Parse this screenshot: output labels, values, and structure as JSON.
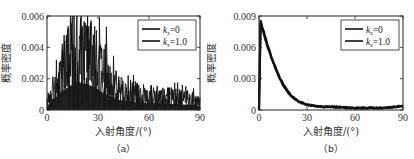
{
  "chart_data": [
    {
      "id": "a",
      "type": "line",
      "caption": "（a）",
      "title": "",
      "xlabel": "入射角度/(°)",
      "ylabel": "概率密度",
      "xlim": [
        0,
        90
      ],
      "ylim": [
        0,
        0.006
      ],
      "xticks": [
        "0",
        "30",
        "60",
        "90"
      ],
      "yticks": [
        "0",
        "0.002",
        "0.004",
        "0.006"
      ],
      "grid": false,
      "legend_position": "upper right",
      "series": [
        {
          "name": "k_s=0",
          "label_main": "k",
          "label_sub": "s",
          "label_rest": "=0",
          "color": "#111111",
          "note": "noisy histogram-like density peaking ~0.005 near 18°, decaying to ~0.0005–0.001 beyond 50°",
          "x": [
            0,
            3,
            6,
            9,
            12,
            15,
            18,
            21,
            24,
            27,
            30,
            33,
            36,
            39,
            42,
            45,
            48,
            51,
            54,
            57,
            60,
            63,
            66,
            69,
            72,
            75,
            78,
            81,
            84,
            87,
            90
          ],
          "values": [
            0.0004,
            0.0012,
            0.0016,
            0.0022,
            0.0026,
            0.003,
            0.0033,
            0.0031,
            0.003,
            0.0027,
            0.0024,
            0.002,
            0.0017,
            0.0014,
            0.0012,
            0.0011,
            0.001,
            0.0009,
            0.0009,
            0.0008,
            0.0008,
            0.0008,
            0.0008,
            0.0007,
            0.0007,
            0.0007,
            0.0007,
            0.0006,
            0.0006,
            0.0006,
            0.0004
          ]
        },
        {
          "name": "k_s=1.0",
          "label_main": "k",
          "label_sub": "s",
          "label_rest": "=1.0",
          "color": "#111111",
          "x": [
            0,
            3,
            6,
            9,
            12,
            15,
            18,
            21,
            24,
            27,
            30,
            33,
            36,
            39,
            42,
            45,
            48,
            51,
            54,
            57,
            60,
            63,
            66,
            69,
            72,
            75,
            78,
            81,
            84,
            87,
            90
          ],
          "values": [
            0.0003,
            0.0011,
            0.0015,
            0.0021,
            0.0025,
            0.0029,
            0.0032,
            0.003,
            0.0029,
            0.0026,
            0.0023,
            0.0019,
            0.0016,
            0.0013,
            0.0011,
            0.001,
            0.0009,
            0.0009,
            0.0008,
            0.0008,
            0.0008,
            0.0007,
            0.0007,
            0.0007,
            0.0007,
            0.0006,
            0.0006,
            0.0006,
            0.0006,
            0.0005,
            0.0004
          ]
        }
      ]
    },
    {
      "id": "b",
      "type": "line",
      "caption": "（b）",
      "title": "",
      "xlabel": "入射角度/(°)",
      "ylabel": "概率密度",
      "xlim": [
        0,
        90
      ],
      "ylim": [
        0,
        0.009
      ],
      "xticks": [
        "0",
        "30",
        "60",
        "90"
      ],
      "yticks": [
        "0",
        "0.003",
        "0.006",
        "0.009"
      ],
      "grid": false,
      "legend_position": "upper right",
      "series": [
        {
          "name": "k_s=0",
          "label_main": "k",
          "label_sub": "s",
          "label_rest": "=0",
          "color": "#111111",
          "x": [
            0,
            1,
            3,
            5,
            8,
            10,
            13,
            15,
            18,
            20,
            25,
            30,
            35,
            40,
            45,
            50,
            60,
            70,
            80,
            85,
            90
          ],
          "values": [
            0.0,
            0.0085,
            0.0075,
            0.0064,
            0.005,
            0.0042,
            0.0031,
            0.0025,
            0.0018,
            0.0014,
            0.0008,
            0.0005,
            0.0004,
            0.0003,
            0.0003,
            0.0003,
            0.0002,
            0.0002,
            0.0002,
            0.0003,
            0.0004
          ]
        },
        {
          "name": "k_s=1.0",
          "label_main": "k",
          "label_sub": "s",
          "label_rest": "=1.0",
          "color": "#111111",
          "x": [
            0,
            1,
            3,
            5,
            8,
            10,
            13,
            15,
            18,
            20,
            25,
            30,
            35,
            40,
            45,
            50,
            60,
            70,
            80,
            85,
            90
          ],
          "values": [
            0.0,
            0.0083,
            0.0073,
            0.0062,
            0.0049,
            0.0041,
            0.003,
            0.0024,
            0.0017,
            0.0013,
            0.0008,
            0.0005,
            0.0004,
            0.0003,
            0.0003,
            0.0002,
            0.0002,
            0.0002,
            0.0002,
            0.0003,
            0.0004
          ]
        }
      ]
    }
  ]
}
